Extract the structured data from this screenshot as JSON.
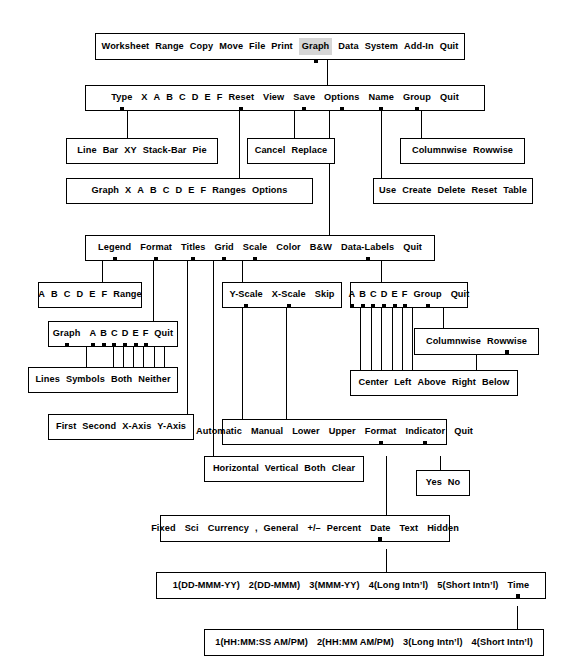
{
  "diagram": {
    "line_color": "#000000",
    "box_fill": "#ffffff",
    "highlight_color": "#d6d6d6"
  },
  "boxes": {
    "main_menu": {
      "name": "main-menu",
      "items": [
        "Worksheet",
        "Range",
        "Copy",
        "Move",
        "File",
        "Print",
        "Graph",
        "Data",
        "System",
        "Add-In",
        "Quit"
      ],
      "highlighted": "Graph"
    },
    "graph_menu": {
      "name": "graph-menu",
      "items": [
        "Type",
        "X",
        "A",
        "B",
        "C",
        "D",
        "E",
        "F",
        "Reset",
        "View",
        "Save",
        "Options",
        "Name",
        "Group",
        "Quit"
      ]
    },
    "type_menu": {
      "name": "graph-type-menu",
      "items": [
        "Line",
        "Bar",
        "XY",
        "Stack-Bar",
        "Pie"
      ]
    },
    "save_menu": {
      "name": "graph-save-menu",
      "items": [
        "Cancel",
        "Replace"
      ]
    },
    "group_menu": {
      "name": "graph-group-menu",
      "items": [
        "Columnwise",
        "Rowwise"
      ]
    },
    "reset_menu": {
      "name": "graph-reset-menu",
      "items": [
        "Graph",
        "X",
        "A",
        "B",
        "C",
        "D",
        "E",
        "F",
        "Ranges",
        "Options"
      ]
    },
    "name_menu": {
      "name": "graph-name-menu",
      "items": [
        "Use",
        "Create",
        "Delete",
        "Reset",
        "Table"
      ]
    },
    "options_menu": {
      "name": "graph-options-menu",
      "items": [
        "Legend",
        "Format",
        "Titles",
        "Grid",
        "Scale",
        "Color",
        "B&W",
        "Data-Labels",
        "Quit"
      ]
    },
    "legend_menu": {
      "name": "options-legend-menu",
      "items": [
        "A",
        "B",
        "C",
        "D",
        "E",
        "F",
        "Range"
      ]
    },
    "format_menu": {
      "name": "options-format-menu",
      "items": [
        "Graph",
        "A",
        "B",
        "C",
        "D",
        "E",
        "F",
        "Quit"
      ]
    },
    "format_style_menu": {
      "name": "options-format-style-menu",
      "items": [
        "Lines",
        "Symbols",
        "Both",
        "Neither"
      ]
    },
    "titles_menu": {
      "name": "options-titles-menu",
      "items": [
        "First",
        "Second",
        "X-Axis",
        "Y-Axis"
      ]
    },
    "grid_menu": {
      "name": "options-grid-menu",
      "items": [
        "Horizontal",
        "Vertical",
        "Both",
        "Clear"
      ]
    },
    "scale_menu": {
      "name": "options-scale-menu",
      "items": [
        "Y-Scale",
        "X-Scale",
        "Skip"
      ]
    },
    "scale_axis_menu": {
      "name": "options-scale-axis-menu",
      "items": [
        "Automatic",
        "Manual",
        "Lower",
        "Upper",
        "Format",
        "Indicator",
        "Quit"
      ]
    },
    "indicator_menu": {
      "name": "options-scale-indicator-menu",
      "items": [
        "Yes",
        "No"
      ]
    },
    "datalabels_menu": {
      "name": "options-data-labels-menu",
      "items": [
        "A",
        "B",
        "C",
        "D",
        "E",
        "F",
        "Group",
        "Quit"
      ]
    },
    "datalabels_group_menu": {
      "name": "data-labels-group-menu",
      "items": [
        "Columnwise",
        "Rowwise"
      ]
    },
    "datalabels_pos_menu": {
      "name": "data-labels-position-menu",
      "items": [
        "Center",
        "Left",
        "Above",
        "Right",
        "Below"
      ]
    },
    "format_type_menu": {
      "name": "format-type-menu",
      "items": [
        "Fixed",
        "Sci",
        "Currency",
        ",",
        "General",
        "+/–",
        "Percent",
        "Date",
        "Text",
        "Hidden"
      ]
    },
    "date_menu": {
      "name": "format-date-menu",
      "items": [
        "1(DD-MMM-YY)",
        "2(DD-MMM)",
        "3(MMM-YY)",
        "4(Long Intn’l)",
        "5(Short Intn’l)",
        "Time"
      ]
    },
    "time_menu": {
      "name": "format-time-menu",
      "items": [
        "1(HH:MM:SS AM/PM)",
        "2(HH:MM AM/PM)",
        "3(Long Intn’l)",
        "4(Short Intn’l)"
      ]
    }
  }
}
